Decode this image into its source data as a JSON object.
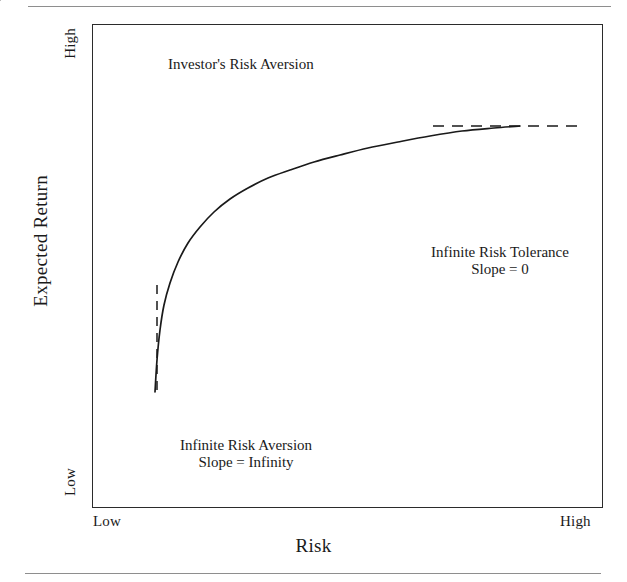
{
  "figure": {
    "name": "risk-return-utility-curve",
    "x_axis": {
      "title": "Risk",
      "tick_low": "Low",
      "tick_high": "High"
    },
    "y_axis": {
      "title": "Expected Return",
      "tick_low": "Low",
      "tick_high": "High"
    },
    "annotations": {
      "investor": "Investor's Risk Aversion",
      "tolerance_line1": "Infinite Risk Tolerance",
      "tolerance_line2": "Slope = 0",
      "aversion_line1": "Infinite Risk Aversion",
      "aversion_line2": "Slope = Infinity"
    },
    "colors": {
      "ink": "#1a1a1a",
      "frame": "#2b2b2b",
      "rule": "#8e8e8e",
      "background": "#ffffff"
    }
  },
  "chart_data": {
    "type": "line",
    "title": "",
    "xlabel": "Risk",
    "ylabel": "Expected Return",
    "xlim": [
      0,
      1
    ],
    "ylim": [
      0,
      1
    ],
    "xtick_labels": [
      "Low",
      "High"
    ],
    "ytick_labels": [
      "Low",
      "High"
    ],
    "grid": false,
    "legend": null,
    "series": [
      {
        "name": "Indifference / utility curve",
        "style": "solid",
        "points_px": [
          [
            155,
            392
          ],
          [
            157,
            360
          ],
          [
            160,
            330
          ],
          [
            164,
            305
          ],
          [
            170,
            283
          ],
          [
            178,
            262
          ],
          [
            188,
            243
          ],
          [
            200,
            227
          ],
          [
            214,
            212
          ],
          [
            230,
            199
          ],
          [
            248,
            188
          ],
          [
            268,
            178
          ],
          [
            290,
            170
          ],
          [
            314,
            162
          ],
          [
            340,
            155
          ],
          [
            368,
            148
          ],
          [
            398,
            142
          ],
          [
            430,
            136
          ],
          [
            462,
            131
          ],
          [
            494,
            128
          ],
          [
            520,
            126
          ]
        ]
      },
      {
        "name": "Vertical asymptote (infinite risk aversion)",
        "style": "dashed",
        "points_px": [
          [
            157,
            285
          ],
          [
            157,
            392
          ]
        ]
      },
      {
        "name": "Horizontal asymptote (infinite risk tolerance)",
        "style": "dashed",
        "points_px": [
          [
            433,
            126
          ],
          [
            578,
            126
          ]
        ]
      },
      {
        "name": "Tangent line at investor's risk aversion point",
        "style": "dashed",
        "points_px": [
          [
            188,
            268
          ],
          [
            300,
            186
          ],
          [
            404,
            123
          ]
        ]
      }
    ],
    "markers": [
      {
        "name": "slope-triangle",
        "type": "rise-run-right-angle",
        "points_px": [
          [
            298,
            190
          ],
          [
            298,
            148
          ],
          [
            352,
            148
          ]
        ]
      }
    ],
    "arrows": [
      {
        "name": "investor-arrow",
        "from_px": [
          244,
          88
        ],
        "to_px": [
          292,
          148
        ]
      },
      {
        "name": "tolerance-arrow",
        "from_px": [
          500,
          240
        ],
        "to_px": [
          500,
          172
        ]
      },
      {
        "name": "aversion-arrow",
        "from_px": [
          248,
          415
        ],
        "to_px": [
          186,
          355
        ]
      }
    ]
  }
}
